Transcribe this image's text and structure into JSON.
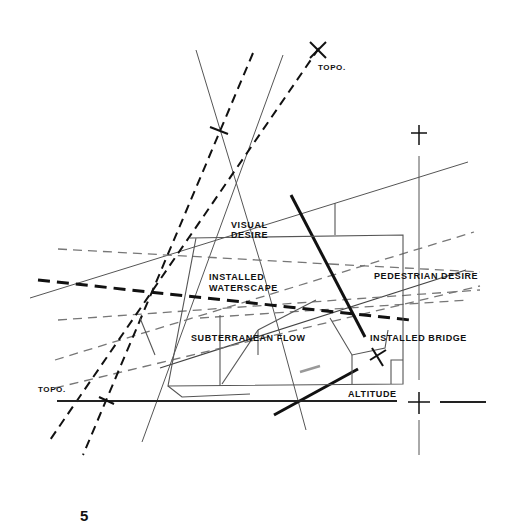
{
  "figure": {
    "number": "5"
  },
  "labels": {
    "visual_desire": [
      "VISUAL",
      "DESIRE"
    ],
    "installed_waterscape": [
      "INSTALLED",
      "WATERSCAPE"
    ],
    "pedestrian_desire": "PEDESTRIAN DESIRE",
    "subterranean_flow": "SUBTERRANEAN FLOW",
    "installed_bridge": "INSTALLED BRIDGE",
    "altitude": "ALTITUDE",
    "topo_top": "TOPO.",
    "topo_left": "TOPO."
  },
  "colors": {
    "ink": "#111111",
    "thin_line": "#555555",
    "gray_dash": "#777777",
    "background": "#ffffff"
  }
}
